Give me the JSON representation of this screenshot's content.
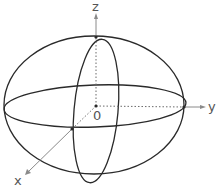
{
  "diagram": {
    "type": "3d-ellipsoid",
    "labels": {
      "z_axis": "z",
      "y_axis": "y",
      "x_axis": "x",
      "origin": "0"
    },
    "colors": {
      "curve": "#2a2a2a",
      "axis": "#8a8a8a",
      "label": "#555555",
      "background": "#ffffff"
    }
  }
}
